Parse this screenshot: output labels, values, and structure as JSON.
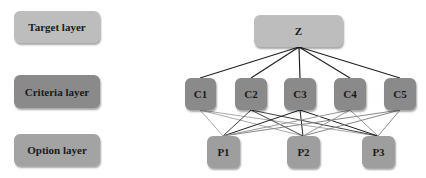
{
  "legend": [
    {
      "label": "Target layer",
      "color": "#bdbdbd"
    },
    {
      "label": "Criteria layer",
      "color": "#8a8a8a"
    },
    {
      "label": "Option layer",
      "color": "#a3a3a3"
    }
  ],
  "target": {
    "label": "Z",
    "color": "#bdbdbd"
  },
  "criteria": [
    {
      "label": "C1"
    },
    {
      "label": "C2"
    },
    {
      "label": "C3"
    },
    {
      "label": "C4"
    },
    {
      "label": "C5"
    }
  ],
  "options": [
    {
      "label": "P1"
    },
    {
      "label": "P2"
    },
    {
      "label": "P3"
    }
  ],
  "colors": {
    "criteria": "#8a8a8a",
    "options": "#9e9e9e",
    "edge_dark": "#222222",
    "edge_light": "#9a9a9a"
  }
}
